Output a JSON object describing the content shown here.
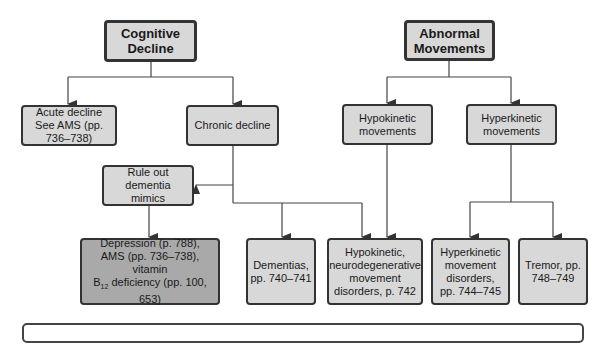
{
  "diagram": {
    "type": "flowchart",
    "roots": {
      "cognitive": "Cognitive Decline",
      "movements": "Abnormal Movements"
    },
    "nodes": {
      "acute": "Acute decline See AMS (pp. 736–738)",
      "chronic": "Chronic decline",
      "rule_out": "Rule out dementia mimics",
      "depression_line1": "Depression (p. 788),",
      "depression_line2": "AMS (pp. 736–738), vitamin",
      "depression_b": "B",
      "depression_sub": "12",
      "depression_line3": " deficiency (pp. 100, 653)",
      "dementias": "Dementias, pp. 740–741",
      "hypokinetic": "Hypokinetic movements",
      "hyperkinetic": "Hyperkinetic movements",
      "hypo_neuro": "Hypokinetic, neurodegenerative movement disorders, p. 742",
      "hyper_disorders": "Hyperkinetic movement disorders, pp. 744–745",
      "tremor": "Tremor, pp. 748–749"
    },
    "edges": [
      [
        "Cognitive Decline",
        "Acute decline See AMS (pp. 736–738)"
      ],
      [
        "Cognitive Decline",
        "Chronic decline"
      ],
      [
        "Chronic decline",
        "Rule out dementia mimics"
      ],
      [
        "Chronic decline",
        "Dementias, pp. 740–741"
      ],
      [
        "Chronic decline",
        "Hypokinetic, neurodegenerative movement disorders, p. 742"
      ],
      [
        "Rule out dementia mimics",
        "Depression / AMS / vitamin B12 deficiency"
      ],
      [
        "Abnormal Movements",
        "Hypokinetic movements"
      ],
      [
        "Abnormal Movements",
        "Hyperkinetic movements"
      ],
      [
        "Hypokinetic movements",
        "Hypokinetic, neurodegenerative movement disorders, p. 742"
      ],
      [
        "Hyperkinetic movements",
        "Hyperkinetic movement disorders, pp. 744–745"
      ],
      [
        "Hyperkinetic movements",
        "Tremor, pp. 748–749"
      ]
    ],
    "colors": {
      "box_fill": "#d8d8d8",
      "dark_box_fill": "#a9a9a9",
      "border": "#333333"
    }
  }
}
